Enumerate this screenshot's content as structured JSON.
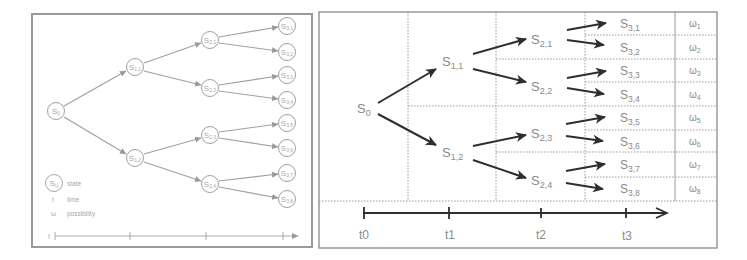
{
  "left_panel": {
    "nodes": [
      {
        "id": "s0",
        "label": "S",
        "sub": "0",
        "x": 56,
        "y": 111
      },
      {
        "id": "s11",
        "label": "S",
        "sub": "1,1",
        "x": 135,
        "y": 67
      },
      {
        "id": "s12",
        "label": "S",
        "sub": "1,2",
        "x": 135,
        "y": 158
      },
      {
        "id": "s21",
        "label": "S",
        "sub": "2,1",
        "x": 210,
        "y": 40
      },
      {
        "id": "s22",
        "label": "S",
        "sub": "2,2",
        "x": 210,
        "y": 88
      },
      {
        "id": "s23",
        "label": "S",
        "sub": "2,3",
        "x": 210,
        "y": 135
      },
      {
        "id": "s24",
        "label": "S",
        "sub": "2,4",
        "x": 210,
        "y": 184
      },
      {
        "id": "s31",
        "label": "S",
        "sub": "3,1",
        "x": 287,
        "y": 26
      },
      {
        "id": "s32",
        "label": "S",
        "sub": "3,2",
        "x": 287,
        "y": 52
      },
      {
        "id": "s33",
        "label": "S",
        "sub": "3,3",
        "x": 287,
        "y": 75
      },
      {
        "id": "s34",
        "label": "S",
        "sub": "3,4",
        "x": 287,
        "y": 100
      },
      {
        "id": "s35",
        "label": "S",
        "sub": "3,5",
        "x": 287,
        "y": 123
      },
      {
        "id": "s36",
        "label": "S",
        "sub": "3,6",
        "x": 287,
        "y": 148
      },
      {
        "id": "s37",
        "label": "S",
        "sub": "3,7",
        "x": 287,
        "y": 173
      },
      {
        "id": "s38",
        "label": "S",
        "sub": "3,8",
        "x": 287,
        "y": 199
      }
    ],
    "legend": {
      "state_symbol": "S",
      "state_sub": "i,j",
      "state_label": "state",
      "time_symbol": "t",
      "time_label": "time",
      "possibility_symbol": "ω",
      "possibility_label": "possibility"
    },
    "timeline": {
      "start_label": "t"
    }
  },
  "right_panel": {
    "root": {
      "label": "S",
      "sub": "0"
    },
    "level1": [
      {
        "label": "S",
        "sub": "1,1"
      },
      {
        "label": "S",
        "sub": "1,2"
      }
    ],
    "level2": [
      {
        "label": "S",
        "sub": "2,1"
      },
      {
        "label": "S",
        "sub": "2,2"
      },
      {
        "label": "S",
        "sub": "2,3"
      },
      {
        "label": "S",
        "sub": "2,4"
      }
    ],
    "level3": [
      {
        "label": "S",
        "sub": "3,1",
        "omega": "ω",
        "omega_sub": "1"
      },
      {
        "label": "S",
        "sub": "3,2",
        "omega": "ω",
        "omega_sub": "2"
      },
      {
        "label": "S",
        "sub": "3,3",
        "omega": "ω",
        "omega_sub": "3"
      },
      {
        "label": "S",
        "sub": "3,4",
        "omega": "ω",
        "omega_sub": "4"
      },
      {
        "label": "S",
        "sub": "3,5",
        "omega": "ω",
        "omega_sub": "5"
      },
      {
        "label": "S",
        "sub": "3,6",
        "omega": "ω",
        "omega_sub": "6"
      },
      {
        "label": "S",
        "sub": "3,7",
        "omega": "ω",
        "omega_sub": "7"
      },
      {
        "label": "S",
        "sub": "3,8",
        "omega": "ω",
        "omega_sub": "8"
      }
    ],
    "timeline": {
      "ticks": [
        "t0",
        "t1",
        "t2",
        "t3"
      ]
    }
  },
  "colors": {
    "left_stroke": "#a0a0a0",
    "right_arrow": "#333333",
    "right_text": "#8a8a8a",
    "grid_dotted": "#9a9a9a",
    "border": "#888888"
  }
}
